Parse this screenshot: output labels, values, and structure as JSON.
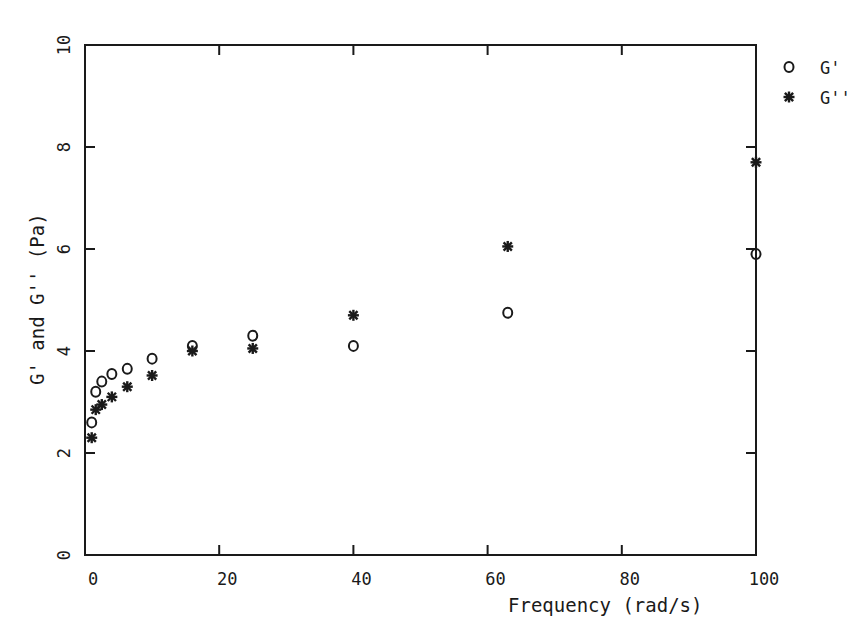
{
  "chart_data": {
    "type": "scatter",
    "title": "",
    "xlabel": "Frequency (rad/s)",
    "ylabel": "G' and G'' (Pa)",
    "xlim": [
      0,
      100
    ],
    "ylim": [
      0,
      10
    ],
    "xticks": [
      0,
      20,
      40,
      60,
      80,
      100
    ],
    "yticks": [
      0,
      2,
      4,
      6,
      8,
      10
    ],
    "grid": false,
    "legend_position": "outside-top-right",
    "x": [
      1,
      1.6,
      2.5,
      4,
      6.3,
      10,
      16,
      25,
      40,
      63,
      100
    ],
    "series": [
      {
        "name": "G'",
        "marker": "circle",
        "values": [
          2.6,
          3.2,
          3.4,
          3.55,
          3.65,
          3.85,
          4.1,
          4.3,
          4.1,
          4.75,
          5.9
        ]
      },
      {
        "name": "G''",
        "marker": "star",
        "values": [
          2.3,
          2.85,
          2.95,
          3.1,
          3.3,
          3.52,
          4.0,
          4.05,
          4.7,
          6.05,
          7.7
        ]
      }
    ]
  },
  "legend": [
    {
      "label": "G'",
      "marker": "circle"
    },
    {
      "label": "G''",
      "marker": "star"
    }
  ]
}
